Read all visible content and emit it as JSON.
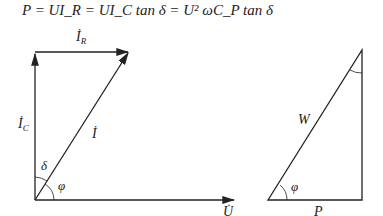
{
  "formula": "P = UI_R = UI_C tan δ = U² ωC_P tan δ",
  "phasor_diagram": {
    "labels": {
      "ir": "İ",
      "ir_sub": "R",
      "ic": "İ",
      "ic_sub": "C",
      "i": "İ",
      "u": "U̇",
      "delta": "δ",
      "phi": "φ"
    }
  },
  "power_triangle": {
    "labels": {
      "w": "W",
      "p": "P",
      "phi": "φ"
    }
  }
}
